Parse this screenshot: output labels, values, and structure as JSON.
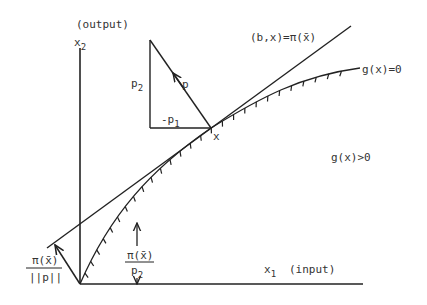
{
  "figure": {
    "type": "economic production diagram"
  },
  "axes": {
    "vertical": {
      "symbol": "x",
      "subscript": "2",
      "caption": "(output)"
    },
    "horizontal": {
      "symbol": "x",
      "subscript": "1",
      "caption": "(input)"
    }
  },
  "labels": {
    "hyperplane": "(b,x)=π(x̄)",
    "boundary": "g(x)=0",
    "region": "g(x)>0",
    "point": "x",
    "price_vector": "p",
    "p2_side": {
      "symbol": "p",
      "subscript": "2"
    },
    "p1_side": {
      "symbol": "-p",
      "subscript": "1"
    },
    "distance_norm": {
      "numerator": "π(x̄)",
      "denominator": "||p||"
    },
    "intercept": {
      "numerator": "π(x̄)",
      "denominator_symbol": "p",
      "denominator_subscript": "2"
    }
  },
  "colors": {
    "ink": "#222222",
    "text": "#333333",
    "background": "#ffffff"
  }
}
